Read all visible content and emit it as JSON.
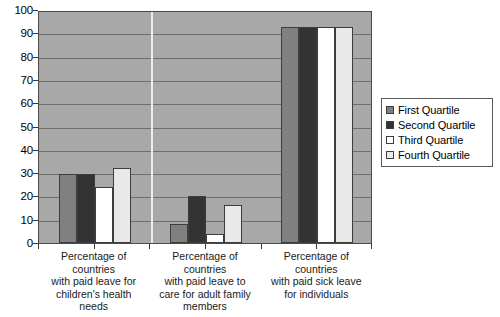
{
  "chart_data": {
    "type": "bar",
    "title": "",
    "subtitle": "",
    "xlabel": "",
    "ylabel": "",
    "ylim": [
      0,
      100
    ],
    "ytick_step": 10,
    "ytick_labels": [
      "0",
      "10",
      "20",
      "30",
      "40",
      "50",
      "60",
      "70",
      "80",
      "90",
      "100"
    ],
    "grid": true,
    "legend_position": "right",
    "categories": [
      "Percentage of countries with paid leave for children's health needs",
      "Percentage of countries with paid leave to care for adult family members",
      "Percentage of countries with paid sick leave for individuals"
    ],
    "category_lines": [
      [
        "Percentage of",
        "countries",
        "with paid leave for",
        "children's health",
        "needs"
      ],
      [
        "Percentage of",
        "countries",
        "with paid leave to",
        "care for adult family",
        "members"
      ],
      [
        "Percentage of",
        "countries",
        "with paid sick leave",
        "for individuals"
      ]
    ],
    "series": [
      {
        "name": "First Quartile",
        "color": "#808080",
        "values": [
          29.5,
          8.0,
          92.5
        ]
      },
      {
        "name": "Second Quartile",
        "color": "#333333",
        "values": [
          29.5,
          20.0,
          92.5
        ]
      },
      {
        "name": "Third Quartile",
        "color": "#ffffff",
        "values": [
          24.0,
          4.0,
          92.5
        ]
      },
      {
        "name": "Fourth Quartile",
        "color": "#e9e9e9",
        "values": [
          32.0,
          16.5,
          92.5
        ]
      }
    ]
  },
  "legend": {
    "items": [
      {
        "label": "First Quartile",
        "swatch": "q1"
      },
      {
        "label": "Second Quartile",
        "swatch": "q2"
      },
      {
        "label": "Third Quartile",
        "swatch": "q3"
      },
      {
        "label": "Fourth Quartile",
        "swatch": "q4"
      }
    ]
  },
  "style": {
    "plot_background": "#a8a8a8",
    "gridline_color": "#6e6e6e",
    "frame_color": "#4a4a4a",
    "page_background": "#ffffff"
  }
}
